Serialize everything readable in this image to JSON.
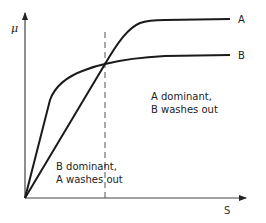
{
  "diagram": {
    "axes": {
      "y_label": "μ",
      "x_label": "S"
    },
    "curves": [
      {
        "name": "A",
        "label": "A",
        "description": "Straight line from origin, saturates at high μ"
      },
      {
        "name": "B",
        "label": "B",
        "description": "Steep initial rise from origin, saturates at lower μ"
      }
    ],
    "regions": {
      "right": {
        "line1": "A dominant,",
        "line2": "B washes out"
      },
      "left": {
        "line1": "B dominant,",
        "line2": "A washes out"
      }
    },
    "crossover_marker": "dashed vertical line at curve intersection",
    "colors": {
      "line": "#1a1a1a",
      "axis": "#333333",
      "background": "#ffffff"
    }
  }
}
